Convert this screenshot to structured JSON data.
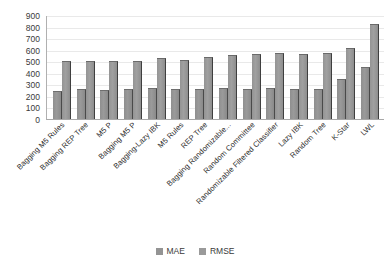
{
  "chart_data": {
    "type": "bar",
    "title": "",
    "xlabel": "",
    "ylabel": "",
    "ylim": [
      0,
      900
    ],
    "yticks": [
      900,
      800,
      700,
      600,
      500,
      400,
      300,
      200,
      100,
      0
    ],
    "grid": true,
    "legend_position": "bottom",
    "categories": [
      "Bagging M5 Rules",
      "Bagging REP Tree",
      "M5 P",
      "Bagging M5 P",
      "Bagging-Lazy IBK",
      "M5 Rules",
      "REP Tree",
      "Bagging Randomizable...",
      "Random Committee",
      "Randomizable Filtered Classifier",
      "Lazy IBK",
      "Random Tree",
      "K-Star",
      "LWL"
    ],
    "series": [
      {
        "name": "MAE",
        "values": [
          235,
          250,
          245,
          250,
          260,
          255,
          250,
          260,
          255,
          260,
          250,
          255,
          340,
          445
        ]
      },
      {
        "name": "RMSE",
        "values": [
          495,
          495,
          490,
          495,
          520,
          505,
          530,
          545,
          555,
          560,
          555,
          560,
          610,
          810
        ]
      }
    ],
    "colors": {
      "MAE": "#949494",
      "RMSE": "#9a9a9a",
      "gridline": "#e9e9e9",
      "axis": "#a8a8a8",
      "text": "#3a3a3a"
    }
  },
  "legend": {
    "items": [
      {
        "label": "MAE",
        "color": "#949494"
      },
      {
        "label": "RMSE",
        "color": "#9a9a9a"
      }
    ]
  }
}
